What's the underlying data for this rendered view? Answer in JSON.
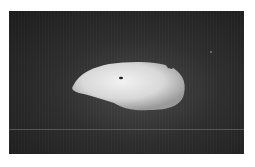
{
  "image": {
    "subject": "potato tuber on dark background",
    "colors": {
      "background": "#2a2a2a",
      "subject": "#e0e0e0",
      "page": "#ffffff"
    }
  }
}
